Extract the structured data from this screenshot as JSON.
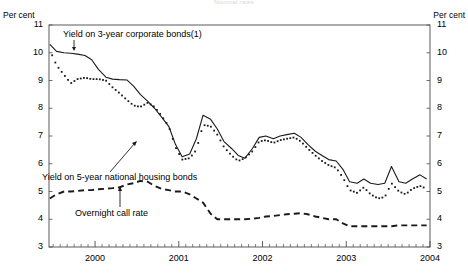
{
  "chart_data": {
    "type": "line",
    "title": "Nominal rates",
    "ylabel_left": "Per cent",
    "ylabel_right": "Per cent",
    "xlabel": "",
    "ylim": [
      3,
      11
    ],
    "yticks": [
      3,
      4,
      5,
      6,
      7,
      8,
      9,
      10,
      11
    ],
    "xticks": [
      "2000",
      "2001",
      "2002",
      "2003",
      "2004"
    ],
    "xlim": [
      1999.45,
      2004.0
    ],
    "grid": false,
    "legend": "inline-annotations",
    "annotations": [
      {
        "text": "Yield on 3-year corporate bonds(1)",
        "series": "corporate_3y"
      },
      {
        "text": "Yield on 5-year national housing bonds",
        "series": "housing_5y"
      },
      {
        "text": "Overnight call rate",
        "series": "call_rate"
      }
    ],
    "footnote": "(1)",
    "series": [
      {
        "name": "Yield on 3-year corporate bonds(1)",
        "style": "solid",
        "x": [
          1999.46,
          1999.54,
          1999.63,
          1999.71,
          1999.79,
          1999.88,
          1999.96,
          2000.04,
          2000.13,
          2000.21,
          2000.29,
          2000.38,
          2000.46,
          2000.54,
          2000.63,
          2000.71,
          2000.79,
          2000.88,
          2000.96,
          2001.04,
          2001.13,
          2001.21,
          2001.29,
          2001.38,
          2001.46,
          2001.54,
          2001.63,
          2001.71,
          2001.79,
          2001.88,
          2001.96,
          2002.04,
          2002.13,
          2002.21,
          2002.29,
          2002.38,
          2002.46,
          2002.54,
          2002.63,
          2002.71,
          2002.79,
          2002.88,
          2002.96,
          2003.04,
          2003.13,
          2003.21,
          2003.29,
          2003.38,
          2003.46,
          2003.54,
          2003.63,
          2003.71,
          2003.79,
          2003.88,
          2003.96
        ],
        "y": [
          10.3,
          10.05,
          10.0,
          9.98,
          9.95,
          9.9,
          9.75,
          9.4,
          9.12,
          9.05,
          9.03,
          9.02,
          8.8,
          8.5,
          8.25,
          8.0,
          7.7,
          7.35,
          6.7,
          6.25,
          6.35,
          6.9,
          7.75,
          7.6,
          7.25,
          6.8,
          6.55,
          6.3,
          6.2,
          6.55,
          6.95,
          7.0,
          6.9,
          7.0,
          7.05,
          7.1,
          6.95,
          6.7,
          6.45,
          6.3,
          6.15,
          6.1,
          5.8,
          5.35,
          5.3,
          5.45,
          5.3,
          5.25,
          5.3,
          5.9,
          5.35,
          5.3,
          5.45,
          5.6,
          5.45
        ],
        "y_end": [
          5.4,
          5.28
        ]
      },
      {
        "name": "Yield on 5-year national housing bonds",
        "style": "dotted",
        "x": [
          1999.46,
          1999.54,
          1999.63,
          1999.71,
          1999.79,
          1999.88,
          1999.96,
          2000.04,
          2000.13,
          2000.21,
          2000.29,
          2000.38,
          2000.46,
          2000.54,
          2000.63,
          2000.71,
          2000.79,
          2000.88,
          2000.96,
          2001.04,
          2001.13,
          2001.21,
          2001.29,
          2001.38,
          2001.46,
          2001.54,
          2001.63,
          2001.71,
          2001.79,
          2001.88,
          2001.96,
          2002.04,
          2002.13,
          2002.21,
          2002.29,
          2002.38,
          2002.46,
          2002.54,
          2002.63,
          2002.71,
          2002.79,
          2002.88,
          2002.96,
          2003.04,
          2003.13,
          2003.21,
          2003.29,
          2003.38,
          2003.46,
          2003.54,
          2003.63,
          2003.71,
          2003.79,
          2003.88,
          2003.96
        ],
        "y": [
          10.1,
          9.55,
          9.2,
          8.9,
          9.05,
          9.1,
          9.05,
          9.05,
          9.0,
          8.75,
          8.55,
          8.3,
          8.1,
          8.05,
          8.2,
          8.05,
          7.75,
          7.35,
          6.6,
          6.15,
          6.2,
          6.5,
          7.4,
          7.35,
          7.05,
          6.6,
          6.3,
          6.1,
          6.2,
          6.45,
          6.8,
          6.85,
          6.75,
          6.85,
          6.9,
          6.95,
          6.8,
          6.55,
          6.3,
          6.1,
          5.95,
          5.85,
          5.5,
          5.05,
          4.95,
          5.15,
          4.9,
          4.75,
          4.8,
          5.3,
          5.0,
          4.9,
          5.1,
          5.2,
          5.1
        ],
        "y_end": [
          5.05,
          4.95
        ]
      },
      {
        "name": "Overnight call rate",
        "style": "dashed",
        "x": [
          1999.46,
          1999.54,
          1999.63,
          1999.71,
          1999.79,
          1999.88,
          1999.96,
          2000.04,
          2000.13,
          2000.21,
          2000.29,
          2000.38,
          2000.46,
          2000.54,
          2000.63,
          2000.71,
          2000.79,
          2000.88,
          2000.96,
          2001.04,
          2001.13,
          2001.21,
          2001.29,
          2001.38,
          2001.46,
          2001.54,
          2001.63,
          2001.71,
          2001.79,
          2001.88,
          2001.96,
          2002.04,
          2002.13,
          2002.21,
          2002.29,
          2002.38,
          2002.46,
          2002.54,
          2002.63,
          2002.71,
          2002.79,
          2002.88,
          2002.96,
          2003.04,
          2003.13,
          2003.21,
          2003.29,
          2003.38,
          2003.46,
          2003.54,
          2003.63,
          2003.71,
          2003.79,
          2003.88,
          2003.96
        ],
        "y": [
          4.75,
          4.9,
          5.0,
          5.0,
          5.02,
          5.05,
          5.05,
          5.08,
          5.1,
          5.12,
          5.15,
          5.25,
          5.3,
          5.38,
          5.35,
          5.2,
          5.1,
          5.05,
          5.0,
          5.0,
          4.9,
          4.75,
          4.6,
          4.2,
          4.0,
          4.0,
          4.0,
          4.0,
          4.0,
          4.02,
          4.05,
          4.1,
          4.12,
          4.15,
          4.18,
          4.2,
          4.22,
          4.18,
          4.1,
          4.05,
          4.0,
          4.0,
          3.85,
          3.75,
          3.75,
          3.75,
          3.75,
          3.75,
          3.75,
          3.75,
          3.78,
          3.78,
          3.78,
          3.78,
          3.78
        ]
      }
    ]
  },
  "axis": {
    "left_unit": "Per cent",
    "right_unit": "Per cent",
    "ylabels": [
      "11",
      "10",
      "9",
      "8",
      "7",
      "6",
      "5",
      "4",
      "3"
    ],
    "xlabels": [
      "2000",
      "2001",
      "2002",
      "2003",
      "2004"
    ]
  },
  "labels": {
    "corporate": "Yield on 3-year corporate bonds(1)",
    "housing": "Yield on 5-year national housing bonds",
    "call": "Overnight call rate"
  },
  "title": "Nominal rates"
}
